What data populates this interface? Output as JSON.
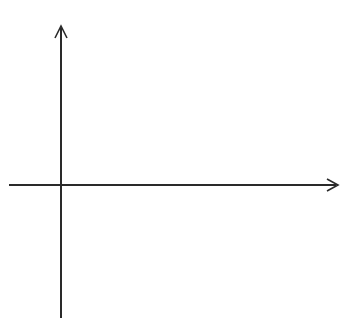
{
  "diagram": {
    "type": "coordinate-grid",
    "x_axis": {
      "label": "x",
      "tick_labels": [
        "−1",
        "1",
        "2",
        "3",
        "4",
        "5",
        "6",
        "7",
        "8",
        "9"
      ],
      "tick_values": [
        -1,
        1,
        2,
        3,
        4,
        5,
        6,
        7,
        8,
        9
      ],
      "range": [
        -2,
        10
      ]
    },
    "y_axis": {
      "label": "y",
      "tick_labels": [
        "4",
        "3",
        "2",
        "1",
        "−1",
        "−2",
        "−3",
        "−4"
      ],
      "tick_values": [
        4,
        3,
        2,
        1,
        -1,
        -2,
        -3,
        -4
      ],
      "range": [
        -5,
        5
      ]
    },
    "grid": {
      "style": "dotted",
      "color": "#9a9a9a"
    },
    "axis_color": "#2a2a2a"
  }
}
